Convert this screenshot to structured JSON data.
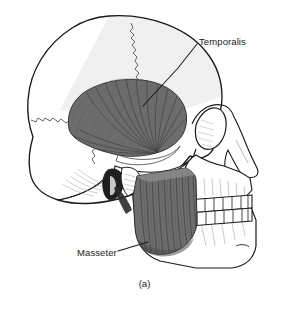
{
  "figure": {
    "type": "anatomical-illustration",
    "background_color": "#ffffff",
    "line_color": "#1a1a1a",
    "muscle_fill_color": "#6e6e6e",
    "muscle_fiber_color": "#3d3d3d",
    "bone_fill_color": "#ffffff",
    "shadow_color": "#d8d8d8",
    "caption": "(a)",
    "footer_text": "",
    "labels": [
      {
        "id": "temporalis",
        "text": "Temporalis",
        "description": "Fan-shaped muscle over the temporal fossa of the skull",
        "leader_line": true
      },
      {
        "id": "masseter",
        "text": "Masseter",
        "description": "Rectangular muscle over the ramus of the mandible",
        "leader_line": true
      }
    ],
    "structures": [
      "cranium",
      "coronal-suture",
      "lambdoid-suture",
      "orbit",
      "nasal-bone",
      "zygomatic-arch",
      "maxilla",
      "mandible",
      "upper-teeth",
      "lower-teeth",
      "mastoid-process",
      "external-acoustic-meatus",
      "mandibular-condyle"
    ]
  }
}
